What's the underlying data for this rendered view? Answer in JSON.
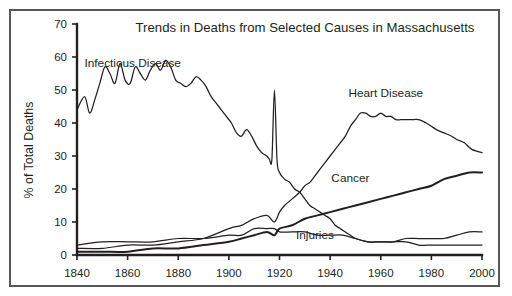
{
  "chart_data": {
    "type": "line",
    "title": "Trends in Deaths from Selected Causes in Massachusetts",
    "xlabel": "",
    "ylabel": "% of Total Deaths",
    "xlim": [
      1840,
      2000
    ],
    "ylim": [
      0,
      70
    ],
    "xticks": [
      1840,
      1860,
      1880,
      1900,
      1920,
      1940,
      1960,
      1980,
      2000
    ],
    "yticks": [
      0,
      10,
      20,
      30,
      40,
      50,
      60,
      70
    ],
    "grid": false,
    "legend_position": "inline-annotations",
    "annotations": [
      {
        "text": "Infectious Disease",
        "x": 1862,
        "y": 57
      },
      {
        "text": "Heart Disease",
        "x": 1962,
        "y": 48
      },
      {
        "text": "Cancer",
        "x": 1948,
        "y": 22
      },
      {
        "text": "Injuries",
        "x": 1934,
        "y": 5
      }
    ],
    "series": [
      {
        "name": "Infectious Disease",
        "x": [
          1840,
          1843,
          1845,
          1847,
          1849,
          1851,
          1853,
          1855,
          1857,
          1859,
          1861,
          1863,
          1865,
          1867,
          1869,
          1871,
          1873,
          1875,
          1877,
          1879,
          1881,
          1883,
          1885,
          1887,
          1889,
          1891,
          1893,
          1895,
          1897,
          1899,
          1901,
          1903,
          1905,
          1907,
          1909,
          1911,
          1913,
          1915,
          1916,
          1917,
          1918,
          1919,
          1920,
          1922,
          1924,
          1926,
          1928,
          1930,
          1932,
          1934,
          1936,
          1938,
          1940,
          1942,
          1944,
          1946,
          1948,
          1950,
          1955,
          1960,
          1965,
          1970,
          1975,
          1980,
          1985,
          1990,
          1995,
          2000
        ],
        "y": [
          44,
          48,
          43,
          47,
          52,
          57,
          55,
          52,
          58,
          53,
          52,
          57,
          55,
          53,
          56,
          58,
          56,
          59,
          57,
          53,
          52,
          51,
          52,
          54,
          53,
          51,
          48,
          46,
          44,
          42,
          40,
          37,
          36,
          38,
          36,
          33,
          31,
          30,
          29,
          29,
          50,
          29,
          25,
          23,
          22,
          20,
          19,
          17,
          15,
          14,
          13,
          12,
          11,
          9,
          8,
          7,
          6,
          5,
          4,
          4,
          4,
          4,
          3,
          3,
          3,
          3,
          3,
          3
        ],
        "label_position": "left"
      },
      {
        "name": "Heart Disease",
        "x": [
          1840,
          1850,
          1860,
          1870,
          1880,
          1890,
          1900,
          1905,
          1910,
          1915,
          1918,
          1920,
          1922,
          1925,
          1928,
          1930,
          1932,
          1934,
          1936,
          1938,
          1940,
          1942,
          1944,
          1946,
          1948,
          1950,
          1952,
          1954,
          1956,
          1958,
          1960,
          1962,
          1964,
          1966,
          1968,
          1970,
          1972,
          1975,
          1978,
          1980,
          1982,
          1985,
          1988,
          1990,
          1993,
          1996,
          2000
        ],
        "y": [
          2,
          2,
          3,
          3,
          4,
          5,
          8,
          9,
          11,
          12,
          10,
          13,
          15,
          17,
          19,
          21,
          22,
          24,
          26,
          28,
          30,
          32,
          34,
          36,
          39,
          41,
          43,
          43,
          42,
          42,
          43,
          42,
          42,
          41,
          41,
          41,
          41,
          41,
          40,
          39,
          38,
          37,
          36,
          35,
          34,
          32,
          31
        ],
        "label_position": "right"
      },
      {
        "name": "Cancer",
        "x": [
          1840,
          1850,
          1860,
          1870,
          1880,
          1890,
          1900,
          1905,
          1910,
          1915,
          1918,
          1920,
          1925,
          1930,
          1935,
          1940,
          1945,
          1950,
          1955,
          1960,
          1965,
          1970,
          1975,
          1980,
          1985,
          1990,
          1995,
          2000
        ],
        "y": [
          1,
          1,
          1,
          2,
          2,
          3,
          4,
          5,
          6,
          7,
          6,
          8,
          9,
          11,
          12,
          13,
          14,
          15,
          16,
          17,
          18,
          19,
          20,
          21,
          23,
          24,
          25,
          25
        ],
        "label_position": "right"
      },
      {
        "name": "Injuries",
        "x": [
          1840,
          1850,
          1860,
          1870,
          1880,
          1890,
          1900,
          1905,
          1910,
          1915,
          1918,
          1920,
          1925,
          1930,
          1935,
          1940,
          1945,
          1950,
          1955,
          1960,
          1965,
          1970,
          1975,
          1980,
          1985,
          1990,
          1995,
          2000
        ],
        "y": [
          3,
          4,
          4,
          4,
          5,
          5,
          6,
          6,
          8,
          8,
          8,
          7,
          7,
          7,
          6,
          6,
          6,
          5,
          4,
          4,
          4,
          5,
          5,
          5,
          5,
          6,
          7,
          7
        ],
        "label_position": "center"
      }
    ]
  },
  "figure": {
    "title": "Trends in Deaths from Selected Causes in Massachusetts",
    "y_axis_title": "% of Total Deaths",
    "tick_labels_y": [
      "70",
      "60",
      "50",
      "40",
      "30",
      "20",
      "10",
      "0"
    ],
    "tick_labels_x": [
      "1840",
      "1860",
      "1880",
      "1900",
      "1920",
      "1940",
      "1960",
      "1980",
      "2000"
    ],
    "series_labels": [
      "Infectious Disease",
      "Heart Disease",
      "Cancer",
      "Injuries"
    ],
    "colors": {
      "line": "#231f20",
      "frame": "#55565a",
      "background": "#ffffff"
    }
  }
}
